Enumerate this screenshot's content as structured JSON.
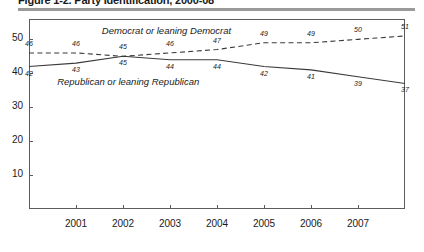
{
  "figure": {
    "title": "Figure 1-2. Party Identification, 2000-08"
  },
  "chart_data": {
    "type": "line",
    "title": "Figure 1-2. Party Identification, 2000-08",
    "xlabel": "",
    "ylabel": "",
    "x": [
      2000,
      2001,
      2002,
      2003,
      2004,
      2005,
      2006,
      2007,
      2008
    ],
    "xtick_labels": [
      "",
      "2001",
      "2002",
      "2003",
      "2004",
      "2005",
      "2006",
      "2007",
      ""
    ],
    "ytick_labels": [
      "10",
      "20",
      "30",
      "40",
      "50"
    ],
    "yticks": [
      10,
      20,
      30,
      40,
      50
    ],
    "ylim": [
      0,
      56
    ],
    "xlim": [
      2000,
      2008
    ],
    "grid": false,
    "legend": "inline-labels",
    "series": [
      {
        "name": "Democrat or leaning Democrat",
        "style": "dashed",
        "color": "#3a3a3a",
        "values": [
          46,
          46,
          45,
          46,
          47,
          49,
          49,
          50,
          51
        ],
        "label_positions": [
          "above",
          "above",
          "above",
          "above",
          "above",
          "above",
          "above",
          "above",
          "above"
        ]
      },
      {
        "name": "Republican or leaning Republican",
        "style": "solid",
        "color": "#3a3a3a",
        "values": [
          42,
          43,
          45,
          44,
          44,
          42,
          41,
          39,
          37
        ],
        "label_positions": [
          "below",
          "below",
          "below",
          "below",
          "below",
          "below",
          "below",
          "below",
          "below"
        ]
      }
    ],
    "annotations": [
      {
        "text": "Democrat or leaning Democrat",
        "x": 2001.55,
        "y": 52.3
      },
      {
        "text": "Republican or leaning Republican",
        "x": 2000.6,
        "y": 37.0
      }
    ]
  }
}
